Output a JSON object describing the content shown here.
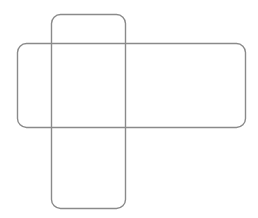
{
  "canvas": {
    "width": 258,
    "height": 218,
    "background": "#ffffff"
  },
  "stroke": {
    "color": "#8a8a8a",
    "width": 1.4
  },
  "shapes": [
    {
      "name": "vertical-rounded-rectangle",
      "x": 51.5,
      "y": 14.5,
      "width": 74,
      "height": 194,
      "radius": 9
    },
    {
      "name": "horizontal-rounded-rectangle",
      "x": 17.5,
      "y": 43.5,
      "width": 228,
      "height": 84,
      "radius": 9
    }
  ]
}
